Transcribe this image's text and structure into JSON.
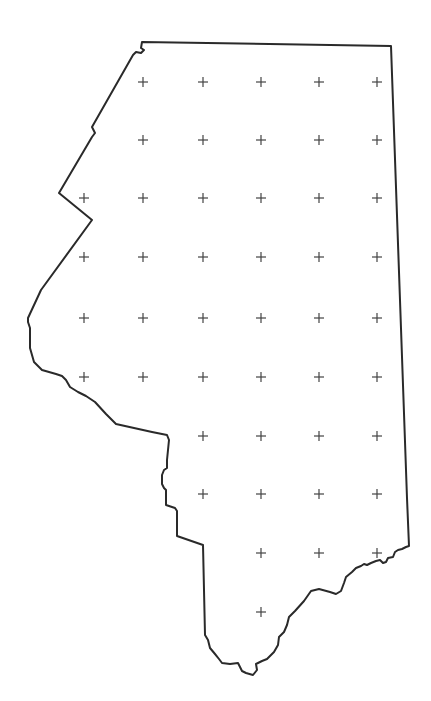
{
  "map": {
    "type": "outline-with-sample-grid",
    "outline_color": "#2a2a2a",
    "cross_color": "#444444",
    "background": "#ffffff",
    "grid_columns_x": [
      84,
      143,
      203,
      261,
      319,
      377
    ],
    "grid_rows_y": [
      82,
      140,
      198,
      257,
      318,
      377,
      436,
      494,
      553,
      612
    ],
    "grid_points": [
      [
        143,
        82
      ],
      [
        203,
        82
      ],
      [
        261,
        82
      ],
      [
        319,
        82
      ],
      [
        377,
        82
      ],
      [
        143,
        140
      ],
      [
        203,
        140
      ],
      [
        261,
        140
      ],
      [
        319,
        140
      ],
      [
        377,
        140
      ],
      [
        84,
        198
      ],
      [
        143,
        198
      ],
      [
        203,
        198
      ],
      [
        261,
        198
      ],
      [
        319,
        198
      ],
      [
        377,
        198
      ],
      [
        84,
        257
      ],
      [
        143,
        257
      ],
      [
        203,
        257
      ],
      [
        261,
        257
      ],
      [
        319,
        257
      ],
      [
        377,
        257
      ],
      [
        84,
        318
      ],
      [
        143,
        318
      ],
      [
        203,
        318
      ],
      [
        261,
        318
      ],
      [
        319,
        318
      ],
      [
        377,
        318
      ],
      [
        84,
        377
      ],
      [
        143,
        377
      ],
      [
        203,
        377
      ],
      [
        261,
        377
      ],
      [
        319,
        377
      ],
      [
        377,
        377
      ],
      [
        203,
        436
      ],
      [
        261,
        436
      ],
      [
        319,
        436
      ],
      [
        377,
        436
      ],
      [
        203,
        494
      ],
      [
        261,
        494
      ],
      [
        319,
        494
      ],
      [
        377,
        494
      ],
      [
        261,
        553
      ],
      [
        319,
        553
      ],
      [
        377,
        553
      ],
      [
        261,
        612
      ]
    ],
    "point_count": 46
  }
}
